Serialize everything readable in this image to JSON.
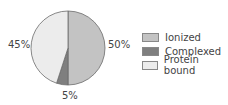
{
  "chart_data": {
    "type": "pie",
    "title": "",
    "categories": [
      "Ionized",
      "Complexed",
      "Protein bound"
    ],
    "values": [
      50,
      5,
      45
    ],
    "value_labels": [
      "50%",
      "5%",
      "45%"
    ],
    "colors": [
      "#c3c3c3",
      "#7f7f7f",
      "#ececec"
    ],
    "start_angle_deg": 0,
    "direction": "clockwise",
    "legend_position": "right"
  },
  "labels": {
    "ionized": "50%",
    "complexed": "5%",
    "protein_bound": "45%"
  },
  "legend": {
    "items": [
      {
        "label": "Ionized",
        "color": "#c3c3c3"
      },
      {
        "label": "Complexed",
        "color": "#7f7f7f"
      },
      {
        "label": "Protein bound",
        "color": "#ececec"
      }
    ]
  }
}
